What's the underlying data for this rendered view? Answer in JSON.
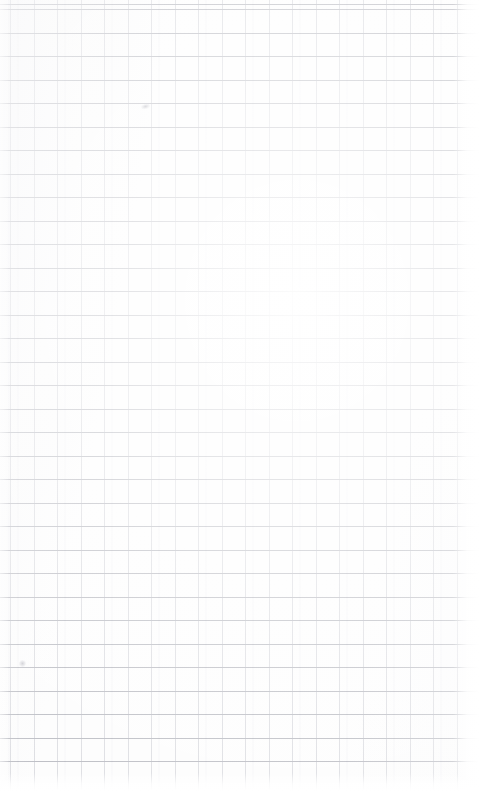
{
  "image": {
    "subject": "blank graph paper sheet",
    "surface_label": "grid ruled paper",
    "text_content": "",
    "visible_text_items": [],
    "width_px": 479,
    "height_px": 791
  },
  "paper": {
    "background_color": "#fdfdfd",
    "page_color": "#ffffff",
    "tone": "near-white"
  },
  "grid": {
    "cell_size_px": 23.5,
    "horizontal_line_color": "#9698a2",
    "horizontal_line_opacity": 0.72,
    "horizontal_line_width_px": 1,
    "horizontal_first_offset_px": 9,
    "horizontal_line_count": 33,
    "vertical_line_color": "#b0b2bc",
    "vertical_line_opacity": 0.48,
    "vertical_line_width_px": 1,
    "vertical_first_offset_px": 10,
    "vertical_line_count": 20,
    "grid_right_edge_px": 468,
    "grid_bottom_edge_px": 781
  },
  "margins": {
    "right_margin_px": 12,
    "bottom_margin_px": 10,
    "left_bleed": "lines reach left edge"
  },
  "blemishes": [
    {
      "name": "upper-smudge",
      "x": 141,
      "y": 104
    },
    {
      "name": "lower-smudge",
      "x": 19,
      "y": 660
    }
  ]
}
